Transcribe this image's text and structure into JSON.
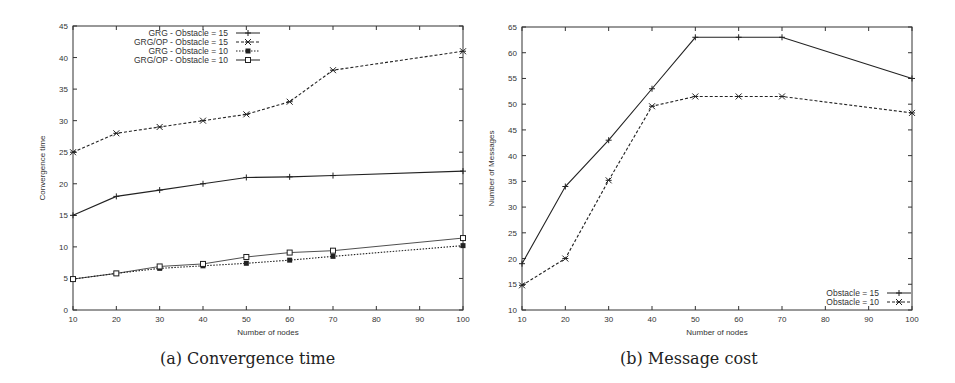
{
  "chart_data": [
    {
      "type": "line",
      "title": "",
      "caption": "(a) Convergence time",
      "xlabel": "Number of nodes",
      "ylabel": "Convergence time",
      "x": [
        10,
        20,
        30,
        40,
        50,
        60,
        70,
        100
      ],
      "xticks": [
        10,
        20,
        30,
        40,
        50,
        60,
        70,
        80,
        90,
        100
      ],
      "yticks": [
        0,
        5,
        10,
        15,
        20,
        25,
        30,
        35,
        40,
        45
      ],
      "xlim": [
        10,
        100
      ],
      "ylim": [
        0,
        45
      ],
      "grid": false,
      "legend_position": "top-left",
      "series": [
        {
          "name": "GRG - Obstacle = 15",
          "style": "solid",
          "marker": "+",
          "values": [
            15,
            18,
            19,
            20,
            21,
            21.1,
            21.3,
            22
          ]
        },
        {
          "name": "GRG/OP  - Obstacle = 15",
          "style": "dashed",
          "marker": "x",
          "values": [
            25,
            28,
            29,
            30,
            31,
            33,
            38,
            41
          ]
        },
        {
          "name": "GRG  - Obstacle  = 10",
          "style": "dotted",
          "marker": "filled-square",
          "values": [
            4.9,
            5.8,
            6.6,
            7.0,
            7.4,
            7.9,
            8.5,
            10.2
          ]
        },
        {
          "name": "GRG/OP - Obstacle = 10",
          "style": "solid-thin",
          "marker": "open-square",
          "values": [
            4.9,
            5.8,
            6.9,
            7.3,
            8.4,
            9.1,
            9.4,
            11.4
          ]
        }
      ]
    },
    {
      "type": "line",
      "title": "",
      "caption": "(b) Message cost",
      "xlabel": "Number of nodes",
      "ylabel": "Number of Messages",
      "x": [
        10,
        20,
        30,
        40,
        50,
        60,
        70,
        100
      ],
      "xticks": [
        10,
        20,
        30,
        40,
        50,
        60,
        70,
        80,
        90,
        100
      ],
      "yticks": [
        10,
        15,
        20,
        25,
        30,
        35,
        40,
        45,
        50,
        55,
        60,
        65
      ],
      "xlim": [
        10,
        100
      ],
      "ylim": [
        10,
        65
      ],
      "grid": false,
      "legend_position": "bottom-right",
      "series": [
        {
          "name": "Obstacle = 15",
          "style": "solid",
          "marker": "+",
          "values": [
            19,
            34,
            43,
            53,
            63,
            63,
            63,
            55
          ]
        },
        {
          "name": "Obstacle  = 10",
          "style": "dashed",
          "marker": "x",
          "values": [
            14.8,
            20,
            35.2,
            49.6,
            51.5,
            51.5,
            51.5,
            48.3
          ]
        }
      ]
    }
  ]
}
